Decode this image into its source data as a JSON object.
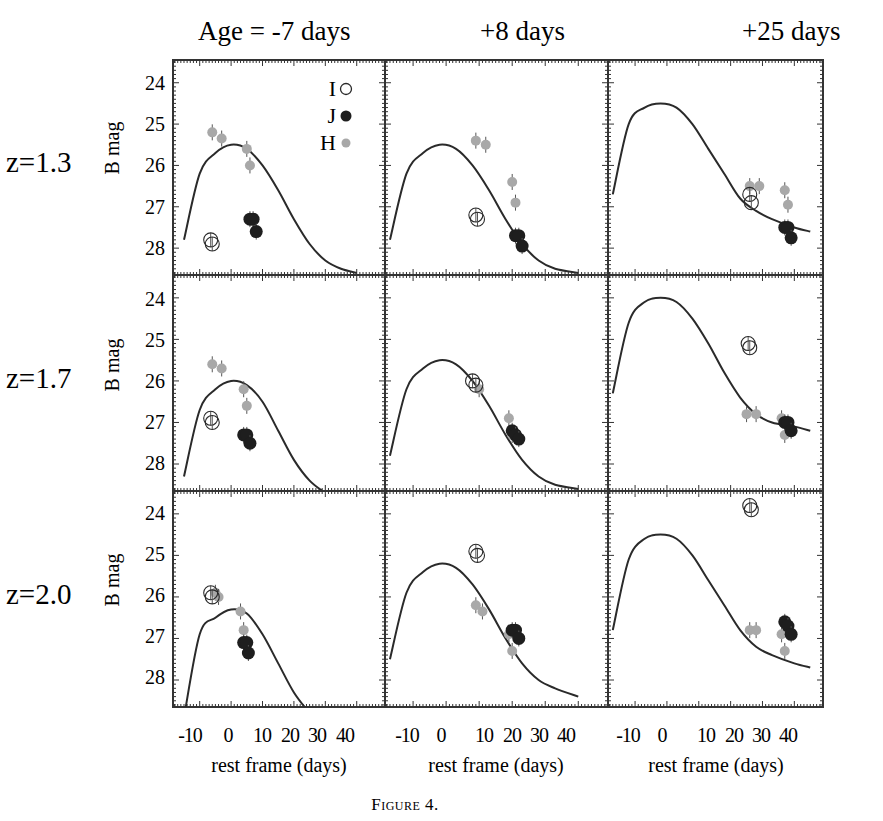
{
  "figure": {
    "caption": "Figure 4.",
    "column_titles": [
      "Age = -7 days",
      "+8 days",
      "+25 days"
    ],
    "row_labels": [
      "z=1.3",
      "z=1.7",
      "z=2.0"
    ],
    "y_axis_label": "B mag",
    "x_axis_label": "rest frame (days)",
    "x_tick_labels": [
      "-10",
      "0",
      "10",
      "20",
      "30",
      "40"
    ],
    "y_tick_labels": [
      "24",
      "25",
      "26",
      "27",
      "28"
    ],
    "legend": [
      {
        "label": "I",
        "marker": "open-circle"
      },
      {
        "label": "J",
        "marker": "filled-black"
      },
      {
        "label": "H",
        "marker": "filled-gray"
      }
    ],
    "colors": {
      "curve": "#2a2a2a",
      "I": "#2a2a2a",
      "J": "#1e1e1e",
      "H": "#a8a8a8",
      "frame": "#333333"
    }
  },
  "chart_data": {
    "type": "scatter",
    "title": "",
    "layout": "3x3 grid of light-curve panels; rows = redshift, columns = supernova age",
    "xlabel": "rest frame (days)",
    "ylabel": "B mag",
    "xlim": [
      -18.5,
      49
    ],
    "ylim": [
      28.65,
      23.45
    ],
    "x_ticks": [
      -10,
      0,
      10,
      20,
      30,
      40
    ],
    "y_ticks": [
      24,
      25,
      26,
      27,
      28
    ],
    "legend_position": "top-right of first panel",
    "grid": false,
    "panels": [
      {
        "row": "z=1.3",
        "col": "Age = -7 days",
        "peak_mag": 25.5,
        "curve": [
          [
            -15,
            27.8
          ],
          [
            -10,
            26.2
          ],
          [
            -5,
            25.7
          ],
          [
            0,
            25.5
          ],
          [
            5,
            25.6
          ],
          [
            10,
            26.0
          ],
          [
            15,
            26.6
          ],
          [
            20,
            27.3
          ],
          [
            25,
            27.9
          ],
          [
            30,
            28.3
          ],
          [
            35,
            28.5
          ],
          [
            40,
            28.6
          ]
        ],
        "I": [
          [
            -6.5,
            27.8
          ],
          [
            -6,
            27.9
          ]
        ],
        "J": [
          [
            6,
            27.3
          ],
          [
            7,
            27.3
          ],
          [
            8,
            27.6
          ]
        ],
        "H": [
          [
            -6,
            25.2
          ],
          [
            -3,
            25.35
          ],
          [
            5,
            25.6
          ],
          [
            6,
            26.0
          ]
        ]
      },
      {
        "row": "z=1.3",
        "col": "+8 days",
        "peak_mag": 25.5,
        "curve": [
          [
            -17,
            27.8
          ],
          [
            -12,
            26.2
          ],
          [
            -7,
            25.7
          ],
          [
            -2,
            25.5
          ],
          [
            3,
            25.6
          ],
          [
            8,
            26.0
          ],
          [
            13,
            26.6
          ],
          [
            18,
            27.3
          ],
          [
            23,
            27.9
          ],
          [
            28,
            28.3
          ],
          [
            33,
            28.5
          ],
          [
            40,
            28.6
          ]
        ],
        "I": [
          [
            9,
            27.2
          ],
          [
            9.5,
            27.3
          ]
        ],
        "J": [
          [
            21,
            27.7
          ],
          [
            22,
            27.7
          ],
          [
            23,
            27.95
          ]
        ],
        "H": [
          [
            9,
            25.4
          ],
          [
            12,
            25.5
          ],
          [
            20,
            26.4
          ],
          [
            21,
            26.9
          ]
        ]
      },
      {
        "row": "z=1.3",
        "col": "+25 days",
        "peak_mag": 24.5,
        "curve": [
          [
            -17,
            26.7
          ],
          [
            -12,
            25.0
          ],
          [
            -7,
            24.6
          ],
          [
            -2,
            24.5
          ],
          [
            3,
            24.6
          ],
          [
            8,
            25.0
          ],
          [
            13,
            25.6
          ],
          [
            18,
            26.2
          ],
          [
            23,
            26.8
          ],
          [
            28,
            27.1
          ],
          [
            33,
            27.3
          ],
          [
            40,
            27.5
          ],
          [
            45,
            27.6
          ]
        ],
        "I": [
          [
            26,
            26.7
          ],
          [
            26.5,
            26.9
          ]
        ],
        "J": [
          [
            37,
            27.5
          ],
          [
            38,
            27.5
          ],
          [
            39,
            27.75
          ]
        ],
        "H": [
          [
            26,
            26.5
          ],
          [
            29,
            26.5
          ],
          [
            37,
            26.6
          ],
          [
            38,
            26.95
          ]
        ]
      },
      {
        "row": "z=1.7",
        "col": "Age = -7 days",
        "peak_mag": 26.0,
        "curve": [
          [
            -15,
            28.3
          ],
          [
            -10,
            26.7
          ],
          [
            -5,
            26.2
          ],
          [
            0,
            26.0
          ],
          [
            5,
            26.1
          ],
          [
            10,
            26.5
          ],
          [
            15,
            27.2
          ],
          [
            20,
            27.9
          ],
          [
            25,
            28.4
          ],
          [
            30,
            28.7
          ]
        ],
        "I": [
          [
            -6.5,
            26.9
          ],
          [
            -6,
            27.0
          ]
        ],
        "J": [
          [
            4,
            27.3
          ],
          [
            5,
            27.3
          ],
          [
            6,
            27.5
          ]
        ],
        "H": [
          [
            -6,
            25.6
          ],
          [
            -3,
            25.7
          ],
          [
            4,
            26.2
          ],
          [
            5,
            26.6
          ]
        ]
      },
      {
        "row": "z=1.7",
        "col": "+8 days",
        "peak_mag": 25.5,
        "curve": [
          [
            -17,
            27.8
          ],
          [
            -12,
            26.2
          ],
          [
            -7,
            25.7
          ],
          [
            -2,
            25.5
          ],
          [
            3,
            25.6
          ],
          [
            8,
            26.0
          ],
          [
            13,
            26.6
          ],
          [
            18,
            27.3
          ],
          [
            23,
            27.9
          ],
          [
            28,
            28.3
          ],
          [
            33,
            28.5
          ],
          [
            40,
            28.6
          ]
        ],
        "I": [
          [
            8,
            26.0
          ],
          [
            9,
            26.1
          ]
        ],
        "J": [
          [
            20,
            27.2
          ],
          [
            21,
            27.3
          ],
          [
            22,
            27.4
          ]
        ],
        "H": [
          [
            10,
            26.2
          ],
          [
            19,
            26.9
          ],
          [
            20,
            27.3
          ]
        ]
      },
      {
        "row": "z=1.7",
        "col": "+25 days",
        "peak_mag": 24.0,
        "curve": [
          [
            -17,
            26.3
          ],
          [
            -12,
            24.6
          ],
          [
            -7,
            24.1
          ],
          [
            -2,
            24.0
          ],
          [
            3,
            24.1
          ],
          [
            8,
            24.5
          ],
          [
            13,
            25.1
          ],
          [
            18,
            25.8
          ],
          [
            23,
            26.4
          ],
          [
            28,
            26.8
          ],
          [
            33,
            27.0
          ],
          [
            40,
            27.1
          ],
          [
            45,
            27.2
          ]
        ],
        "I": [
          [
            25.5,
            25.1
          ],
          [
            26,
            25.2
          ]
        ],
        "J": [
          [
            37,
            27.0
          ],
          [
            38,
            27.0
          ],
          [
            39,
            27.2
          ]
        ],
        "H": [
          [
            25,
            26.8
          ],
          [
            28,
            26.8
          ],
          [
            36,
            26.9
          ],
          [
            37,
            27.3
          ]
        ]
      },
      {
        "row": "z=2.0",
        "col": "Age = -7 days",
        "peak_mag": 26.3,
        "curve": [
          [
            -15,
            28.9
          ],
          [
            -10,
            26.9
          ],
          [
            -5,
            26.5
          ],
          [
            0,
            26.3
          ],
          [
            5,
            26.4
          ],
          [
            10,
            26.9
          ],
          [
            15,
            27.6
          ],
          [
            20,
            28.3
          ],
          [
            25,
            28.8
          ]
        ],
        "I": [
          [
            -6.5,
            25.9
          ],
          [
            -6,
            26.0
          ]
        ],
        "J": [
          [
            4,
            27.1
          ],
          [
            5,
            27.1
          ],
          [
            5.5,
            27.35
          ]
        ],
        "H": [
          [
            -5,
            25.9
          ],
          [
            -4,
            26.0
          ],
          [
            3,
            26.35
          ],
          [
            4,
            26.8
          ]
        ]
      },
      {
        "row": "z=2.0",
        "col": "+8 days",
        "peak_mag": 25.2,
        "curve": [
          [
            -17,
            27.5
          ],
          [
            -12,
            25.9
          ],
          [
            -7,
            25.4
          ],
          [
            -2,
            25.2
          ],
          [
            3,
            25.3
          ],
          [
            8,
            25.7
          ],
          [
            13,
            26.3
          ],
          [
            18,
            27.0
          ],
          [
            23,
            27.6
          ],
          [
            28,
            28.0
          ],
          [
            33,
            28.2
          ],
          [
            40,
            28.4
          ]
        ],
        "I": [
          [
            9,
            24.9
          ],
          [
            9.5,
            25.0
          ]
        ],
        "J": [
          [
            20,
            26.8
          ],
          [
            21,
            26.8
          ],
          [
            22,
            27.0
          ]
        ],
        "H": [
          [
            9,
            26.2
          ],
          [
            11,
            26.35
          ],
          [
            19,
            26.9
          ],
          [
            20,
            27.3
          ]
        ]
      },
      {
        "row": "z=2.0",
        "col": "+25 days",
        "peak_mag": 24.5,
        "curve": [
          [
            -17,
            26.8
          ],
          [
            -12,
            25.1
          ],
          [
            -7,
            24.6
          ],
          [
            -2,
            24.5
          ],
          [
            3,
            24.6
          ],
          [
            8,
            25.0
          ],
          [
            13,
            25.6
          ],
          [
            18,
            26.2
          ],
          [
            23,
            26.8
          ],
          [
            28,
            27.2
          ],
          [
            33,
            27.4
          ],
          [
            40,
            27.6
          ],
          [
            45,
            27.7
          ]
        ],
        "I": [
          [
            26,
            23.8
          ],
          [
            26.5,
            23.9
          ]
        ],
        "J": [
          [
            37,
            26.6
          ],
          [
            38,
            26.7
          ],
          [
            39,
            26.9
          ]
        ],
        "H": [
          [
            26,
            26.8
          ],
          [
            28,
            26.8
          ],
          [
            36,
            26.9
          ],
          [
            37,
            27.3
          ]
        ]
      }
    ]
  }
}
